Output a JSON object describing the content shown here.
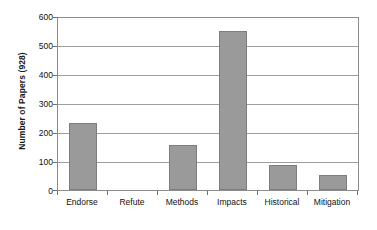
{
  "chart_data": {
    "type": "bar",
    "title": "",
    "subtitle": "",
    "xlabel": "",
    "ylabel": "Number of Papers (928)",
    "categories": [
      "Endorse",
      "Refute",
      "Methods",
      "Impacts",
      "Historical",
      "Mitigation"
    ],
    "values": [
      232,
      0,
      155,
      547,
      85,
      53
    ],
    "series": [
      {
        "name": "Number of Papers",
        "values": [
          232,
          0,
          155,
          547,
          85,
          53
        ]
      }
    ],
    "ylim": [
      0,
      600
    ],
    "ytick_labels": [
      "0",
      "100",
      "200",
      "300",
      "400",
      "500",
      "600"
    ],
    "ytick_values": [
      0,
      100,
      200,
      300,
      400,
      500,
      600
    ],
    "grid": "horizontal",
    "legend": "none",
    "annotations": [],
    "colors": {
      "bar_fill": "#9a9a9a",
      "bar_border": "#7d7d7d",
      "gridline": "#9d9d9d",
      "frame": "#8c8c8c",
      "text": "#111111",
      "background": "#ffffff"
    }
  }
}
